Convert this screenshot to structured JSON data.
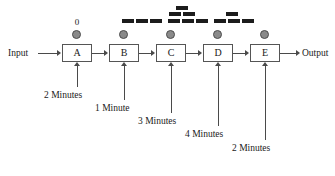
{
  "diagram": {
    "input_label": "Input",
    "output_label": "Output",
    "zero_label": "0",
    "line_color": "#4a4a4a",
    "box_border_color": "#555555",
    "dot_fill_color": "#8a8a8a",
    "dot_border_color": "#4d4d4d",
    "block_color": "#1c1c1c",
    "background_color": "#ffffff",
    "stations": [
      {
        "id": "A",
        "label": "A",
        "duration_label": "2 Minutes",
        "duration_minutes": 2,
        "has_dot": true,
        "has_zero": true
      },
      {
        "id": "B",
        "label": "B",
        "duration_label": "1 Minute",
        "duration_minutes": 1,
        "has_dot": true,
        "has_zero": false
      },
      {
        "id": "C",
        "label": "C",
        "duration_label": "3 Minutes",
        "duration_minutes": 3,
        "has_dot": true,
        "has_zero": false
      },
      {
        "id": "D",
        "label": "D",
        "duration_label": "4 Minutes",
        "duration_minutes": 4,
        "has_dot": true,
        "has_zero": false
      },
      {
        "id": "E",
        "label": "E",
        "duration_label": "2 Minutes",
        "duration_minutes": 2,
        "has_dot": true,
        "has_zero": false
      }
    ]
  },
  "top_blocks": {
    "description": "rows of small dark rectangles arranged above the stations",
    "rows": [
      {
        "y": 6,
        "blocks": [
          {
            "x": 176,
            "w": 12
          }
        ]
      },
      {
        "y": 12,
        "blocks": [
          {
            "x": 169,
            "w": 12
          },
          {
            "x": 183,
            "w": 12
          },
          {
            "x": 226,
            "w": 12
          }
        ]
      },
      {
        "y": 19,
        "blocks": [
          {
            "x": 122,
            "w": 12
          },
          {
            "x": 136,
            "w": 12
          },
          {
            "x": 150,
            "w": 12
          },
          {
            "x": 168,
            "w": 12
          },
          {
            "x": 182,
            "w": 12
          },
          {
            "x": 196,
            "w": 12
          },
          {
            "x": 214,
            "w": 12
          },
          {
            "x": 228,
            "w": 12
          },
          {
            "x": 242,
            "w": 12
          }
        ]
      }
    ]
  }
}
